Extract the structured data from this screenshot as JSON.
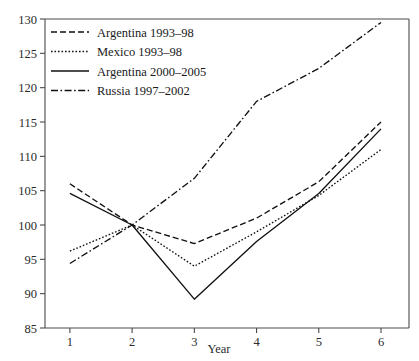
{
  "chart_data": {
    "type": "line",
    "title": "",
    "xlabel": "Year",
    "ylabel": "",
    "x": [
      1,
      2,
      3,
      4,
      5,
      6
    ],
    "xtick_labels": [
      "1",
      "2",
      "3",
      "4",
      "5",
      "6"
    ],
    "ytick_labels": [
      "85",
      "90",
      "95",
      "100",
      "105",
      "110",
      "115",
      "120",
      "125",
      "130"
    ],
    "ytick_values": [
      85,
      90,
      95,
      100,
      105,
      110,
      115,
      120,
      125,
      130
    ],
    "xlim": [
      0.6,
      6.45
    ],
    "ylim": [
      85,
      130
    ],
    "grid": false,
    "legend_position": "top-left",
    "series": [
      {
        "name": "Argentina 1993–98",
        "style": "dashed",
        "dasharray": "6,3",
        "values": [
          106.0,
          100.0,
          97.3,
          101.0,
          106.3,
          115.0
        ]
      },
      {
        "name": "Mexico 1993–98",
        "style": "dotted",
        "dasharray": "1.6,1.9",
        "values": [
          96.2,
          100.0,
          94.0,
          99.0,
          104.3,
          111.0
        ]
      },
      {
        "name": "Argentina 2000–2005",
        "style": "solid",
        "dasharray": "",
        "values": [
          104.6,
          100.0,
          89.2,
          97.6,
          104.6,
          114.0
        ]
      },
      {
        "name": "Russia 1997–2002",
        "style": "dash-dot",
        "dasharray": "7,2.5,1.6,2.5",
        "values": [
          94.4,
          100.0,
          106.8,
          118.0,
          122.8,
          129.5
        ]
      }
    ]
  }
}
